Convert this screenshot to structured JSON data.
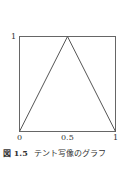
{
  "chart_data": {
    "type": "line",
    "title": "テント写像のグラフ",
    "figure_label": "図 1.5",
    "xlabel": "",
    "ylabel": "",
    "xlim": [
      0,
      1
    ],
    "ylim": [
      0,
      1
    ],
    "grid": false,
    "legend": null,
    "x_ticks": [
      "0",
      "0.5",
      "1"
    ],
    "y_ticks": [
      "1"
    ],
    "series": [
      {
        "name": "tent map",
        "x": [
          0,
          0.5,
          1
        ],
        "y": [
          0,
          1,
          0
        ]
      }
    ],
    "frame": "box",
    "line_color": "#555555"
  },
  "axes": {
    "y_tick_1": "1",
    "x_tick_0": "0",
    "x_tick_05": "0.5",
    "x_tick_1": "1"
  },
  "caption": {
    "figure_number": "図 1.5",
    "text": "テント写像のグラフ"
  }
}
